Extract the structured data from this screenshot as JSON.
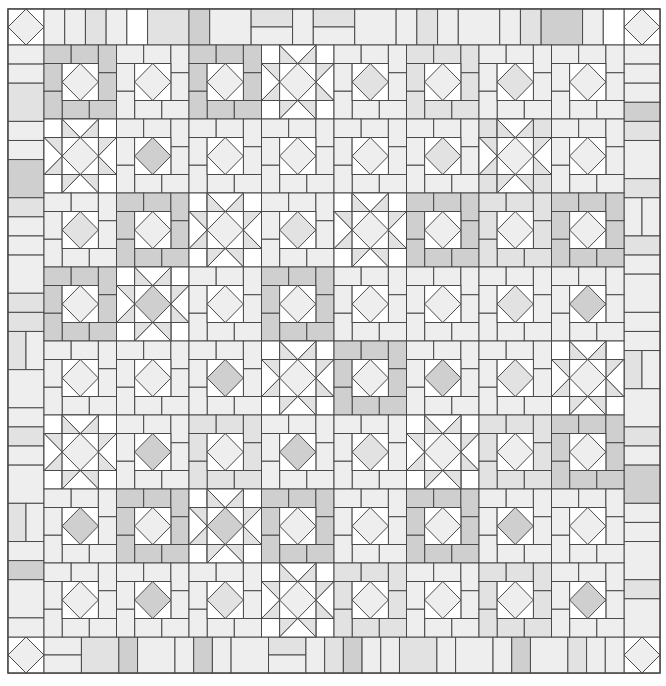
{
  "quilt": {
    "title": "Square-in-a-square and sawtooth star quilt pattern",
    "origin": [
      8,
      9
    ],
    "border": 36,
    "block_w": 72.5,
    "block_h": 74,
    "colors": {
      "white": "#ffffff",
      "light": "#eeeeee",
      "mid": "#e2e2e2",
      "dark": "#cfcfcf",
      "line": "#4a4a4a",
      "background": "#ffffff"
    },
    "legend": {
      "D": "square-in-a-square block with pinwheel frame",
      "S": "sawtooth star block"
    },
    "blocks": [
      [
        {
          "t": "D",
          "c": "light",
          "f": "dark"
        },
        {
          "t": "D",
          "c": "light",
          "f": "light"
        },
        {
          "t": "D",
          "c": "light",
          "f": "dark"
        },
        {
          "t": "S",
          "c": "light",
          "f": "light"
        },
        {
          "t": "D",
          "c": "mid",
          "f": "light"
        },
        {
          "t": "D",
          "c": "light",
          "f": "mid"
        },
        {
          "t": "D",
          "c": "mid",
          "f": "light"
        },
        {
          "t": "D",
          "c": "light",
          "f": "light"
        }
      ],
      [
        {
          "t": "S",
          "c": "light",
          "f": "light"
        },
        {
          "t": "D",
          "c": "dark",
          "f": "light"
        },
        {
          "t": "D",
          "c": "light",
          "f": "light"
        },
        {
          "t": "D",
          "c": "light",
          "f": "light"
        },
        {
          "t": "D",
          "c": "light",
          "f": "light"
        },
        {
          "t": "D",
          "c": "mid",
          "f": "light"
        },
        {
          "t": "S",
          "c": "light",
          "f": "mid"
        },
        {
          "t": "D",
          "c": "light",
          "f": "light"
        }
      ],
      [
        {
          "t": "D",
          "c": "mid",
          "f": "light"
        },
        {
          "t": "D",
          "c": "light",
          "f": "dark"
        },
        {
          "t": "S",
          "c": "light",
          "f": "light"
        },
        {
          "t": "D",
          "c": "mid",
          "f": "light"
        },
        {
          "t": "S",
          "c": "light",
          "f": "light"
        },
        {
          "t": "D",
          "c": "light",
          "f": "dark"
        },
        {
          "t": "D",
          "c": "light",
          "f": "mid"
        },
        {
          "t": "D",
          "c": "light",
          "f": "dark"
        }
      ],
      [
        {
          "t": "D",
          "c": "light",
          "f": "dark"
        },
        {
          "t": "S",
          "c": "dark",
          "f": "light"
        },
        {
          "t": "D",
          "c": "light",
          "f": "light"
        },
        {
          "t": "D",
          "c": "light",
          "f": "dark"
        },
        {
          "t": "D",
          "c": "light",
          "f": "light"
        },
        {
          "t": "D",
          "c": "light",
          "f": "light"
        },
        {
          "t": "D",
          "c": "mid",
          "f": "light"
        },
        {
          "t": "D",
          "c": "dark",
          "f": "light"
        }
      ],
      [
        {
          "t": "D",
          "c": "light",
          "f": "light"
        },
        {
          "t": "D",
          "c": "light",
          "f": "light"
        },
        {
          "t": "D",
          "c": "dark",
          "f": "light"
        },
        {
          "t": "S",
          "c": "light",
          "f": "light"
        },
        {
          "t": "D",
          "c": "light",
          "f": "dark"
        },
        {
          "t": "D",
          "c": "dark",
          "f": "light"
        },
        {
          "t": "D",
          "c": "mid",
          "f": "light"
        },
        {
          "t": "S",
          "c": "light",
          "f": "light"
        }
      ],
      [
        {
          "t": "S",
          "c": "light",
          "f": "light"
        },
        {
          "t": "D",
          "c": "dark",
          "f": "light"
        },
        {
          "t": "D",
          "c": "light",
          "f": "mid"
        },
        {
          "t": "D",
          "c": "dark",
          "f": "light"
        },
        {
          "t": "D",
          "c": "mid",
          "f": "light"
        },
        {
          "t": "S",
          "c": "light",
          "f": "light"
        },
        {
          "t": "D",
          "c": "light",
          "f": "mid"
        },
        {
          "t": "D",
          "c": "light",
          "f": "dark"
        }
      ],
      [
        {
          "t": "D",
          "c": "dark",
          "f": "light"
        },
        {
          "t": "D",
          "c": "light",
          "f": "dark"
        },
        {
          "t": "S",
          "c": "dark",
          "f": "light"
        },
        {
          "t": "D",
          "c": "light",
          "f": "dark"
        },
        {
          "t": "D",
          "c": "light",
          "f": "light"
        },
        {
          "t": "D",
          "c": "light",
          "f": "dark"
        },
        {
          "t": "D",
          "c": "dark",
          "f": "light"
        },
        {
          "t": "D",
          "c": "light",
          "f": "light"
        }
      ],
      [
        {
          "t": "D",
          "c": "light",
          "f": "light"
        },
        {
          "t": "D",
          "c": "dark",
          "f": "light"
        },
        {
          "t": "D",
          "c": "mid",
          "f": "light"
        },
        {
          "t": "S",
          "c": "light",
          "f": "light"
        },
        {
          "t": "D",
          "c": "light",
          "f": "mid"
        },
        {
          "t": "D",
          "c": "light",
          "f": "light"
        },
        {
          "t": "D",
          "c": "light",
          "f": "mid"
        },
        {
          "t": "D",
          "c": "dark",
          "f": "light"
        }
      ]
    ],
    "border_top": [
      {
        "w": 1.5,
        "s": "light",
        "split": "v"
      },
      {
        "w": 0.75,
        "s": "mid"
      },
      {
        "w": 0.75,
        "s": "light"
      },
      {
        "w": 0.75,
        "s": "white"
      },
      {
        "w": 1.5,
        "s": "mid"
      },
      {
        "w": 0.75,
        "s": "dark"
      },
      {
        "w": 1.5,
        "s": "light"
      },
      {
        "w": 1.5,
        "s": "mid",
        "split": "h"
      },
      {
        "w": 0.75,
        "s": "light"
      },
      {
        "w": 1.5,
        "s": "mid",
        "split": "h"
      },
      {
        "w": 1.5,
        "s": "light"
      },
      {
        "w": 0.75,
        "s": "light"
      },
      {
        "w": 0.75,
        "s": "mid"
      },
      {
        "w": 0.75,
        "s": "light"
      },
      {
        "w": 1.5,
        "s": "light"
      },
      {
        "w": 0.75,
        "s": "light"
      },
      {
        "w": 0.75,
        "s": "mid"
      },
      {
        "w": 1.5,
        "s": "dark"
      },
      {
        "w": 0.75,
        "s": "light"
      },
      {
        "w": 0.75,
        "s": "white"
      }
    ],
    "border_bottom": [
      {
        "w": 1.5,
        "s": "light",
        "split": "h"
      },
      {
        "w": 1.5,
        "s": "mid"
      },
      {
        "w": 0.75,
        "s": "dark"
      },
      {
        "w": 1.5,
        "s": "light"
      },
      {
        "w": 0.75,
        "s": "light"
      },
      {
        "w": 0.75,
        "s": "dark"
      },
      {
        "w": 0.75,
        "s": "light"
      },
      {
        "w": 1.5,
        "s": "light"
      },
      {
        "w": 1.5,
        "s": "mid",
        "split": "h"
      },
      {
        "w": 0.75,
        "s": "light"
      },
      {
        "w": 0.75,
        "s": "mid"
      },
      {
        "w": 0.75,
        "s": "dark"
      },
      {
        "w": 0.75,
        "s": "light"
      },
      {
        "w": 0.75,
        "s": "light"
      },
      {
        "w": 1.5,
        "s": "mid"
      },
      {
        "w": 0.75,
        "s": "light"
      },
      {
        "w": 1.5,
        "s": "light"
      },
      {
        "w": 0.75,
        "s": "light"
      },
      {
        "w": 0.75,
        "s": "dark"
      },
      {
        "w": 1.5,
        "s": "light"
      },
      {
        "w": 0.75,
        "s": "mid"
      },
      {
        "w": 0.75,
        "s": "light"
      },
      {
        "w": 0.75,
        "s": "light"
      }
    ],
    "border_left": [
      {
        "h": 0.75,
        "s": "light"
      },
      {
        "h": 0.75,
        "s": "light"
      },
      {
        "h": 1.5,
        "s": "mid"
      },
      {
        "h": 0.75,
        "s": "light"
      },
      {
        "h": 0.75,
        "s": "light"
      },
      {
        "h": 1.5,
        "s": "dark"
      },
      {
        "h": 0.75,
        "s": "mid"
      },
      {
        "h": 0.75,
        "s": "light"
      },
      {
        "h": 0.75,
        "s": "light"
      },
      {
        "h": 1.5,
        "s": "light"
      },
      {
        "h": 0.75,
        "s": "mid"
      },
      {
        "h": 0.75,
        "s": "mid"
      },
      {
        "h": 1.5,
        "s": "mid",
        "split": "v"
      },
      {
        "h": 1.5,
        "s": "light"
      },
      {
        "h": 0.75,
        "s": "light"
      },
      {
        "h": 0.75,
        "s": "mid"
      },
      {
        "h": 0.75,
        "s": "light"
      },
      {
        "h": 1.5,
        "s": "light"
      },
      {
        "h": 1.5,
        "s": "mid",
        "split": "v"
      },
      {
        "h": 0.75,
        "s": "light"
      },
      {
        "h": 0.75,
        "s": "dark"
      },
      {
        "h": 1.5,
        "s": "light"
      },
      {
        "h": 0.75,
        "s": "light"
      }
    ],
    "border_right": [
      {
        "h": 0.75,
        "s": "light"
      },
      {
        "h": 0.75,
        "s": "light"
      },
      {
        "h": 0.75,
        "s": "light"
      },
      {
        "h": 0.75,
        "s": "dark"
      },
      {
        "h": 0.75,
        "s": "mid"
      },
      {
        "h": 1.5,
        "s": "light"
      },
      {
        "h": 0.75,
        "s": "mid"
      },
      {
        "h": 1.5,
        "s": "light",
        "split": "v"
      },
      {
        "h": 0.75,
        "s": "mid"
      },
      {
        "h": 0.75,
        "s": "light"
      },
      {
        "h": 1.5,
        "s": "light"
      },
      {
        "h": 0.75,
        "s": "light"
      },
      {
        "h": 0.75,
        "s": "light"
      },
      {
        "h": 1.5,
        "s": "mid",
        "split": "v"
      },
      {
        "h": 1.5,
        "s": "light"
      },
      {
        "h": 0.75,
        "s": "mid"
      },
      {
        "h": 0.75,
        "s": "light"
      },
      {
        "h": 1.5,
        "s": "dark"
      },
      {
        "h": 0.75,
        "s": "light"
      },
      {
        "h": 0.75,
        "s": "light"
      },
      {
        "h": 1.5,
        "s": "light"
      },
      {
        "h": 0.75,
        "s": "mid"
      },
      {
        "h": 1.5,
        "s": "light"
      }
    ],
    "corners": [
      "top-left",
      "top-right",
      "bottom-left",
      "bottom-right"
    ]
  }
}
